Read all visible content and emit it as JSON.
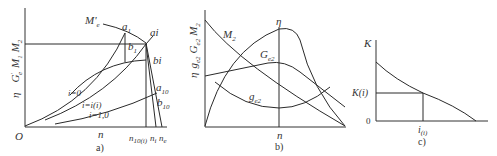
{
  "panels": [
    {
      "id": "a",
      "caption": "a)",
      "y_axis_label": "η   G'e  M1  M2",
      "y_label_parts": {
        "eta": "η",
        "g": "G",
        "g_sup": "'",
        "g_sub": "e",
        "m1": "M",
        "m1_sub": "1",
        "m2": "M",
        "m2_sub": "2"
      },
      "origin_label": "O",
      "x_label": "n",
      "x_ticks": [
        "n10(i)",
        "ni",
        "ne"
      ],
      "x_tick_parts": {
        "n10_sub": "10(i)",
        "ni_sub": "i",
        "ne_sub": "e",
        "n": "n"
      },
      "curve_labels": {
        "me": "M'",
        "me_sub": "e",
        "a1": "a",
        "a1_sub": "1",
        "ai": "ai",
        "b1": "b",
        "b1_sub": "1",
        "bi": "bi",
        "a10": "a",
        "a10_sub": "10",
        "b10": "b",
        "b10_sub": "10"
      },
      "curves": [
        "i=0",
        "i=i(i)",
        "i=1,0"
      ]
    },
    {
      "id": "b",
      "caption": "b)",
      "y_axis_label": "η  ge2  Ge2  M2",
      "y_label_parts": {
        "eta": "η",
        "g": "g",
        "g_sub": "e2",
        "G": "G",
        "G_sub": "e2",
        "m": "M",
        "m_sub": "2"
      },
      "x_label": "n",
      "curve_labels": {
        "eta": "η",
        "m2": "M",
        "m2_sub": "2",
        "Ge2": "G",
        "Ge2_sub": "e2",
        "ge2": "g",
        "ge2_sub": "e2"
      }
    },
    {
      "id": "c",
      "caption": "c)",
      "y_axis_label": "K",
      "origin_label": "0",
      "y_tick": "K(i)",
      "x_tick": "i",
      "x_tick_sub": "(i)"
    }
  ]
}
